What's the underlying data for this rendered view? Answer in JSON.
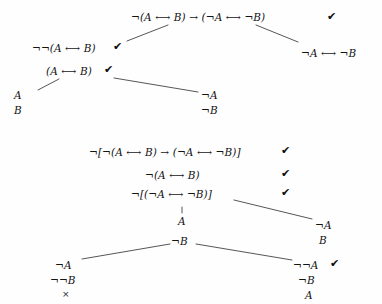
{
  "diagram": {
    "symbols": {
      "negation": "¬",
      "biconditional": "⟷",
      "conditional": "→",
      "check": "✔",
      "closure": "×"
    },
    "ink_color": "#141414",
    "background_color": "#fefefe",
    "trees": [
      {
        "id": "tree-upper",
        "name": "upper-tree",
        "nodes": [
          {
            "id": "u1",
            "text": "¬(A ⟷ B) → (¬A ⟷ ¬B)",
            "checked": true
          },
          {
            "id": "u2",
            "text": "¬¬(A ⟷ B)",
            "checked": true
          },
          {
            "id": "u3",
            "text": "¬A ⟷ ¬B",
            "checked": false
          },
          {
            "id": "u4",
            "text": "(A ⟷ B)",
            "checked": true
          },
          {
            "id": "u5",
            "text": "A",
            "checked": false
          },
          {
            "id": "u6",
            "text": "B",
            "checked": false
          },
          {
            "id": "u7",
            "text": "¬A",
            "checked": false
          },
          {
            "id": "u8",
            "text": "¬B",
            "checked": false
          }
        ]
      },
      {
        "id": "tree-lower",
        "name": "lower-tree",
        "nodes": [
          {
            "id": "l1",
            "text": "¬[¬(A ⟷ B) → (¬A ⟷ ¬B)]",
            "checked": true
          },
          {
            "id": "l2",
            "text": "¬(A ⟷ B)",
            "checked": true
          },
          {
            "id": "l3",
            "text": "¬[(¬A ⟷ ¬B)]",
            "checked": true
          },
          {
            "id": "l4",
            "text": "A",
            "checked": false
          },
          {
            "id": "l5",
            "text": "¬B",
            "checked": false
          },
          {
            "id": "l6",
            "text": "¬A",
            "checked": false
          },
          {
            "id": "l7",
            "text": "B",
            "checked": false
          },
          {
            "id": "l8",
            "text": "¬A",
            "checked": false
          },
          {
            "id": "l9",
            "text": "¬¬B",
            "checked": false
          },
          {
            "id": "l10",
            "text": "×",
            "checked": false
          },
          {
            "id": "l11",
            "text": "¬¬A",
            "checked": true
          },
          {
            "id": "l12",
            "text": "¬B",
            "checked": false
          },
          {
            "id": "l13",
            "text": "A",
            "checked": false
          }
        ]
      }
    ]
  }
}
